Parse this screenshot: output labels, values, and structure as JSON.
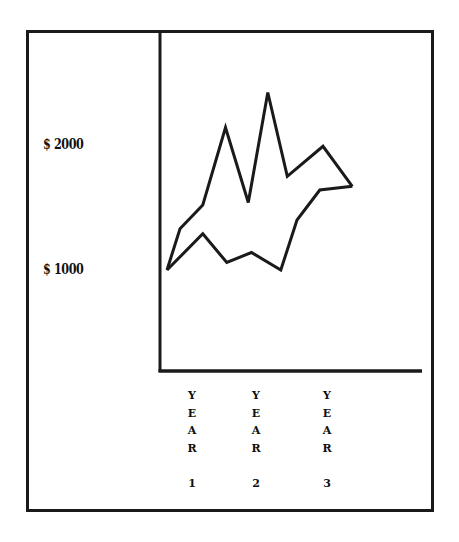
{
  "chart_data": {
    "type": "line",
    "title": "",
    "xlabel": "",
    "ylabel": "",
    "y_tick_labels": [
      "$ 2000",
      "$ 1000"
    ],
    "y_ticks": [
      2000,
      1000
    ],
    "x_tick_labels": [
      "YEAR 1",
      "YEAR 2",
      "YEAR 3"
    ],
    "ylim": [
      200,
      2600
    ],
    "grid": false,
    "legend": null,
    "series": [
      {
        "name": "upper",
        "points": [
          {
            "x": 0.0,
            "y": 1000
          },
          {
            "x": 0.2,
            "y": 1330
          },
          {
            "x": 0.55,
            "y": 1520
          },
          {
            "x": 0.9,
            "y": 2140
          },
          {
            "x": 1.25,
            "y": 1540
          },
          {
            "x": 1.55,
            "y": 2420
          },
          {
            "x": 1.85,
            "y": 1750
          },
          {
            "x": 2.4,
            "y": 1990
          },
          {
            "x": 2.85,
            "y": 1670
          }
        ]
      },
      {
        "name": "lower",
        "points": [
          {
            "x": 0.0,
            "y": 1000
          },
          {
            "x": 0.55,
            "y": 1290
          },
          {
            "x": 0.92,
            "y": 1060
          },
          {
            "x": 1.3,
            "y": 1140
          },
          {
            "x": 1.75,
            "y": 1000
          },
          {
            "x": 2.0,
            "y": 1400
          },
          {
            "x": 2.35,
            "y": 1640
          },
          {
            "x": 2.85,
            "y": 1670
          }
        ]
      }
    ]
  },
  "labels": {
    "y2000": "$ 2000",
    "y1000": "$ 1000",
    "x": [
      {
        "word": [
          "Y",
          "E",
          "A",
          "R"
        ],
        "num": "1"
      },
      {
        "word": [
          "Y",
          "E",
          "A",
          "R"
        ],
        "num": "2"
      },
      {
        "word": [
          "Y",
          "E",
          "A",
          "R"
        ],
        "num": "3"
      }
    ]
  },
  "colors": {
    "line": "#1a1a1a",
    "background": "#ffffff"
  }
}
